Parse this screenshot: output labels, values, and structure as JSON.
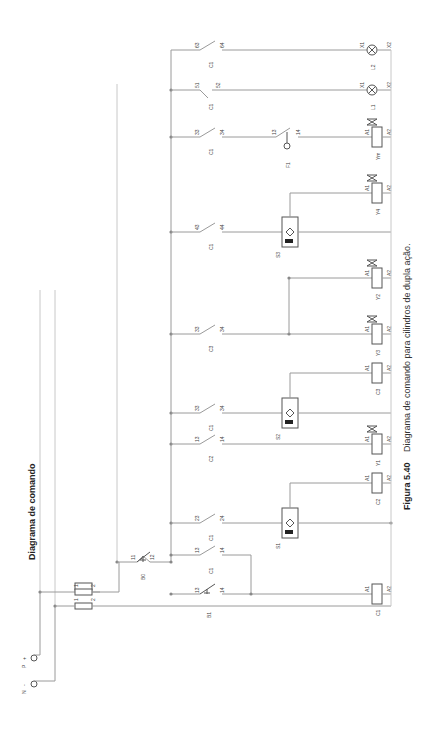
{
  "title": "Diagrama de comando",
  "caption": {
    "figure": "Figura 5.40",
    "text": "Diagrama de comando para cilindros de dupla ação."
  },
  "supply": {
    "p_label": "P",
    "p_sign": "+",
    "n_label": "N",
    "n_sign": "-",
    "fuse_terminals": [
      "1",
      "2"
    ]
  },
  "components": {
    "b0": {
      "tag": "B0",
      "t1": "11",
      "t2": "12"
    },
    "b1": {
      "tag": "B1",
      "t1": "13",
      "t2": "14"
    },
    "c1_hold": {
      "tag": "C1",
      "t1": "13",
      "t2": "14"
    },
    "c1_23": {
      "tag": "C1",
      "t1": "23",
      "t2": "24"
    },
    "c2_13": {
      "tag": "C2",
      "t1": "13",
      "t2": "14"
    },
    "c1_33": {
      "tag": "C1",
      "t1": "33",
      "t2": "34"
    },
    "c3_33": {
      "tag": "C3",
      "t1": "33",
      "t2": "34"
    },
    "c1_43": {
      "tag": "C1",
      "t1": "43",
      "t2": "44"
    },
    "c1_33b": {
      "tag": "C1",
      "t1": "33",
      "t2": "34"
    },
    "c1_51": {
      "tag": "C1",
      "t1": "51",
      "t2": "52"
    },
    "c1_63": {
      "tag": "C1",
      "t1": "63",
      "t2": "64"
    },
    "f1": {
      "tag": "F1",
      "t1": "13",
      "t2": "14"
    },
    "s1": {
      "tag": "S1"
    },
    "s2": {
      "tag": "S2"
    },
    "s3": {
      "tag": "S3"
    },
    "coil_c1": {
      "tag": "C1",
      "a1": "A1",
      "a2": "A2"
    },
    "coil_c2": {
      "tag": "C2",
      "a1": "A1",
      "a2": "A2"
    },
    "coil_y1": {
      "tag": "Y1",
      "a1": "A1",
      "a2": "A2"
    },
    "coil_c3": {
      "tag": "C3",
      "a1": "A1",
      "a2": "A2"
    },
    "coil_y3": {
      "tag": "Y3",
      "a1": "A1",
      "a2": "A2"
    },
    "coil_y2": {
      "tag": "Y2",
      "a1": "A1",
      "a2": "A2"
    },
    "coil_y4": {
      "tag": "Y4",
      "a1": "A1",
      "a2": "A2"
    },
    "coil_ym": {
      "tag": "Ym",
      "a1": "A1",
      "a2": "A2"
    },
    "lamp_l1": {
      "tag": "L1",
      "x1": "X1",
      "x2": "X2"
    },
    "lamp_l2": {
      "tag": "L2",
      "x1": "X1",
      "x2": "X2"
    }
  },
  "sensor_signs": {
    "plus": "+",
    "minus": "-"
  }
}
